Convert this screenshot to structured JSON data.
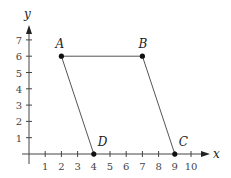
{
  "diagram": {
    "type": "coordinate-plane-parallelogram",
    "axes": {
      "x_label": "x",
      "y_label": "y",
      "x_ticks": [
        "1",
        "2",
        "3",
        "4",
        "5",
        "6",
        "7",
        "8",
        "9",
        "10"
      ],
      "y_ticks": [
        "1",
        "2",
        "3",
        "4",
        "5",
        "6",
        "7"
      ]
    },
    "points": [
      {
        "label": "A",
        "x": 2,
        "y": 6
      },
      {
        "label": "B",
        "x": 7,
        "y": 6
      },
      {
        "label": "C",
        "x": 9,
        "y": 0
      },
      {
        "label": "D",
        "x": 4,
        "y": 0
      }
    ],
    "segments": [
      [
        "A",
        "B"
      ],
      [
        "A",
        "D"
      ],
      [
        "B",
        "C"
      ]
    ],
    "colors": {
      "line": "#555555",
      "point": "#111111",
      "axis": "#444444"
    }
  }
}
